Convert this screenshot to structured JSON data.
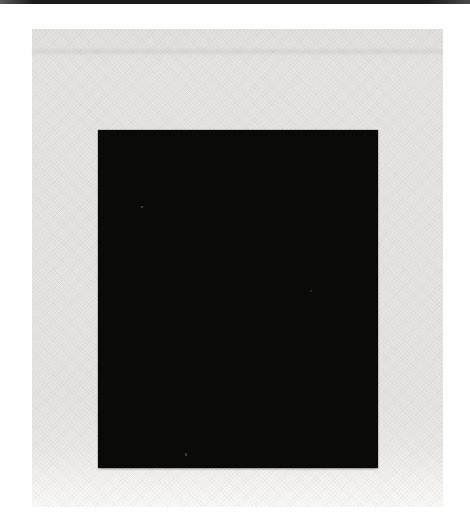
{
  "image": {
    "kind": "scanned reproduction of an abstract painting",
    "subject": "solid black rectangle centered on a pale gray halftone-textured ground with white page margins",
    "text_content": "none",
    "colors": {
      "page_background": "#ffffff",
      "scan_edge_line": "#1b1b1b",
      "canvas_ground": "#e8e7e4",
      "black_square": "#0a0a09"
    }
  }
}
